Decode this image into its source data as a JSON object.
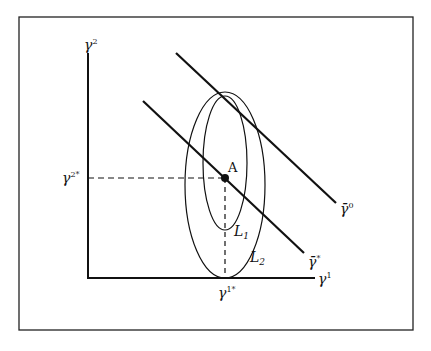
{
  "diagram": {
    "frame": {
      "x": 19,
      "y": 17,
      "width": 394,
      "height": 313
    },
    "axes": {
      "origin": [
        88,
        278
      ],
      "y_axis_top": 53,
      "x_axis_right": 315,
      "y_label": "γ",
      "y_label_sup": "2",
      "x_label": "γ",
      "x_label_sup": "1"
    },
    "point_a": {
      "label": "A",
      "x": 225,
      "y": 178
    },
    "optimum_labels": {
      "y_star": "γ",
      "y_star_sup": "2*",
      "x_star": "γ",
      "x_star_sup": "1*"
    },
    "ellipses": [
      {
        "name": "L1",
        "label": "L",
        "sub": "1",
        "cx": 225,
        "cy": 163,
        "rx": 22,
        "ry": 67
      },
      {
        "name": "L2",
        "label": "L",
        "sub": "2",
        "cx": 225,
        "cy": 185,
        "rx": 40,
        "ry": 93
      }
    ],
    "lines": [
      {
        "name": "gamma-bar-star",
        "label": "γ̄",
        "sup": "*",
        "x1": 143,
        "y1": 101,
        "x2": 304,
        "y2": 253
      },
      {
        "name": "gamma-bar-zero",
        "label": "γ̄",
        "sup": "0",
        "x1": 176,
        "y1": 53,
        "x2": 336,
        "y2": 203
      }
    ],
    "colors": {
      "ink": "#111111",
      "background": "#ffffff"
    }
  }
}
